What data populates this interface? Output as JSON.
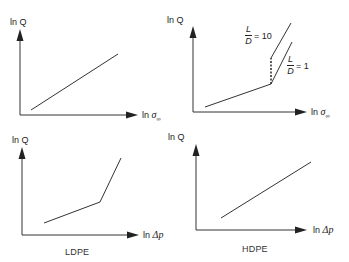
{
  "figure": {
    "panels": [
      {
        "id": "top-left",
        "y_label": "ln Q",
        "x_label_prefix": "ln",
        "x_label_symbol": "σ",
        "x_label_sub": "∞",
        "description": "single straight line, positive slope"
      },
      {
        "id": "top-right",
        "y_label": "ln Q",
        "x_label_prefix": "ln",
        "x_label_symbol": "σ",
        "x_label_sub": "∞",
        "description": "low-slope line then split into two steep branches",
        "branches": [
          {
            "label_num": "L",
            "label_den": "D",
            "label_value": "= 10"
          },
          {
            "label_num": "L",
            "label_den": "D",
            "label_value": "= 1"
          }
        ]
      },
      {
        "id": "bottom-left",
        "y_label": "ln Q",
        "x_label_prefix": "ln",
        "x_label_symbol": "Δp",
        "x_label_sub": "",
        "caption": "LDPE",
        "description": "two-segment line, slope increases"
      },
      {
        "id": "bottom-right",
        "y_label": "ln Q",
        "x_label_prefix": "ln",
        "x_label_symbol": "Δp",
        "x_label_sub": "",
        "caption": "HDPE",
        "description": "single straight line, positive slope"
      }
    ],
    "colors": {
      "line": "#2a2a2a",
      "background": "#ffffff"
    }
  }
}
